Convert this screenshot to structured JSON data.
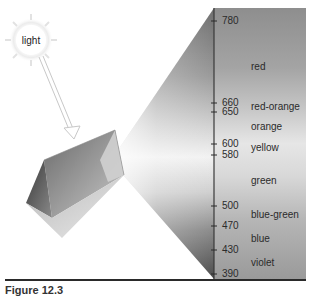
{
  "light_source": {
    "label": "light"
  },
  "spectrum": {
    "scale_unit": "nm",
    "ticks": [
      780,
      660,
      650,
      600,
      580,
      500,
      470,
      430,
      390
    ],
    "tick_labels": [
      "780",
      "660",
      "650",
      "600",
      "580",
      "500",
      "470",
      "430",
      "390"
    ],
    "bands": [
      {
        "name": "red",
        "label": "red"
      },
      {
        "name": "red-orange",
        "label": "red-orange"
      },
      {
        "name": "orange",
        "label": "orange"
      },
      {
        "name": "yellow",
        "label": "yellow"
      },
      {
        "name": "green",
        "label": "green"
      },
      {
        "name": "blue-green",
        "label": "blue-green"
      },
      {
        "name": "blue",
        "label": "blue"
      },
      {
        "name": "violet",
        "label": "violet"
      }
    ]
  },
  "caption": {
    "text": "Figure 12.3"
  }
}
